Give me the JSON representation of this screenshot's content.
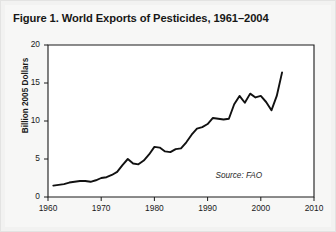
{
  "figure": {
    "title": "Figure 1. World Exports of Pesticides, 1961–2004",
    "source_note": "Source: FAO"
  },
  "chart_data": {
    "type": "line",
    "title": "Figure 1. World Exports of Pesticides, 1961–2004",
    "xlabel": "",
    "ylabel": "Billion 2005 Dollars",
    "xlim": [
      1960,
      2010
    ],
    "ylim": [
      0,
      20
    ],
    "xticks": [
      1960,
      1970,
      1980,
      1990,
      2000,
      2010
    ],
    "xtick_labels": [
      "1960",
      "1970",
      "1980",
      "1990",
      "2000",
      "2010"
    ],
    "yticks": [
      0,
      5,
      10,
      15,
      20
    ],
    "ytick_labels": [
      "0",
      "5",
      "10",
      "15",
      "20"
    ],
    "grid": false,
    "legend": false,
    "annotations": [
      {
        "text": "Source: FAO",
        "x": 2002,
        "y": 2.6,
        "style": "italic"
      }
    ],
    "series": [
      {
        "name": "World pesticide exports",
        "color": "#111111",
        "x": [
          1961,
          1962,
          1963,
          1964,
          1965,
          1966,
          1967,
          1968,
          1969,
          1970,
          1971,
          1972,
          1973,
          1974,
          1975,
          1976,
          1977,
          1978,
          1979,
          1980,
          1981,
          1982,
          1983,
          1984,
          1985,
          1986,
          1987,
          1988,
          1989,
          1990,
          1991,
          1992,
          1993,
          1994,
          1995,
          1996,
          1997,
          1998,
          1999,
          2000,
          2001,
          2002,
          2003,
          2004
        ],
        "values": [
          1.5,
          1.6,
          1.7,
          1.9,
          2.0,
          2.1,
          2.1,
          2.0,
          2.2,
          2.5,
          2.6,
          2.9,
          3.3,
          4.2,
          5.0,
          4.4,
          4.3,
          4.8,
          5.6,
          6.6,
          6.5,
          6.0,
          5.9,
          6.3,
          6.4,
          7.2,
          8.2,
          9.0,
          9.2,
          9.6,
          10.4,
          10.3,
          10.2,
          10.3,
          12.2,
          13.3,
          12.4,
          13.6,
          13.1,
          13.3,
          12.5,
          11.4,
          13.3,
          16.4
        ]
      }
    ]
  }
}
